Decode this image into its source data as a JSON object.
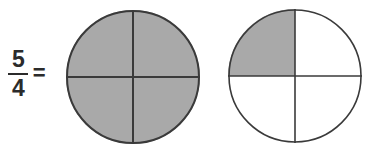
{
  "figure": {
    "name": "improper-fraction-five-fourths-circle-model",
    "background_color": "#ffffff"
  },
  "expression": {
    "numerator": "5",
    "denominator": "4",
    "equals": "=",
    "text_color": "#2b2b2b"
  },
  "colors": {
    "shaded": "#a9a9a9",
    "unshaded": "#ffffff",
    "outline": "#3a3a3a",
    "divider": "#3a3a3a"
  },
  "circles": [
    {
      "label": "circle-1",
      "center_x": 133,
      "center_y": 77,
      "radius": 67,
      "total_parts": 4,
      "shaded_parts": 4,
      "quadrants": [
        {
          "name": "top-left",
          "shaded": true
        },
        {
          "name": "top-right",
          "shaded": true
        },
        {
          "name": "bottom-right",
          "shaded": true
        },
        {
          "name": "bottom-left",
          "shaded": true
        }
      ]
    },
    {
      "label": "circle-2",
      "center_x": 295,
      "center_y": 76,
      "radius": 67,
      "total_parts": 4,
      "shaded_parts": 1,
      "quadrants": [
        {
          "name": "top-left",
          "shaded": true
        },
        {
          "name": "top-right",
          "shaded": false
        },
        {
          "name": "bottom-right",
          "shaded": false
        },
        {
          "name": "bottom-left",
          "shaded": false
        }
      ]
    }
  ]
}
